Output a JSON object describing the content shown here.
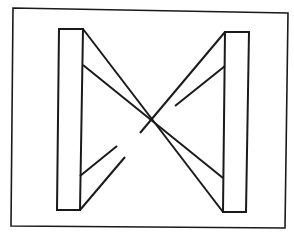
{
  "figure": {
    "stroke_color": "#1a1a1a",
    "background_color": "#ffffff",
    "frame": {
      "points": "13,8 288,13 285,228 11,226"
    },
    "left_pillar": {
      "points": "59,29 83,29 80,210 57,210"
    },
    "right_pillar": {
      "points": "225,32 249,32 246,212 223,212"
    },
    "band_back": {
      "outer_upper": "225,32 140,133",
      "outer_lower": "80,210 125,157",
      "inner_upper": "225,66 175,106",
      "inner_lower": "80,176 117,146"
    },
    "band_front": {
      "outer": "83,29 223,212",
      "inner": "83,65 223,178"
    }
  }
}
